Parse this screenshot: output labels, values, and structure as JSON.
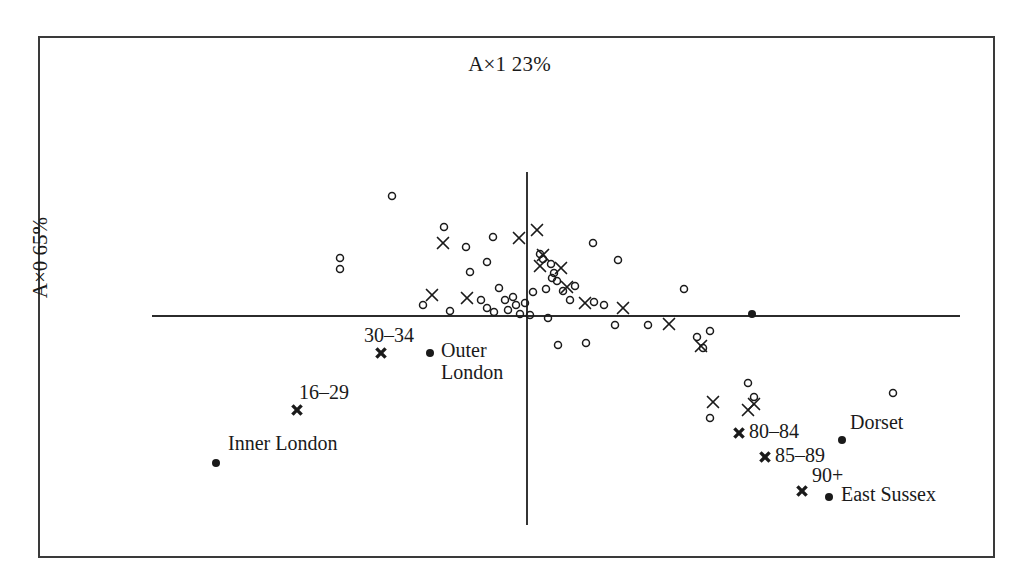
{
  "figure": {
    "title": "A×1 23%",
    "ylabel": "A×0 65%",
    "frame": {
      "x": 38,
      "y": 36,
      "width": 957,
      "height": 522
    }
  },
  "chart_data": {
    "type": "scatter",
    "title": "A×1 23%",
    "xlabel": "",
    "ylabel": "A×0 65%",
    "grid": false,
    "legend": "none",
    "axes": {
      "horizontal_axis_y_px": 316,
      "horizontal_axis_x_start_px": 152,
      "horizontal_axis_x_end_px": 960,
      "vertical_axis_x_px": 527,
      "vertical_axis_y_start_px": 172,
      "vertical_axis_y_end_px": 525,
      "origin_px": [
        527,
        316
      ]
    },
    "series": [
      {
        "name": "districts-open-circle",
        "marker": "open-circle",
        "points": [
          [
            392,
            196
          ],
          [
            444,
            227
          ],
          [
            340,
            258
          ],
          [
            340,
            269
          ],
          [
            466,
            247
          ],
          [
            470,
            272
          ],
          [
            487,
            262
          ],
          [
            493,
            237
          ],
          [
            499,
            288
          ],
          [
            505,
            300
          ],
          [
            481,
            300
          ],
          [
            513,
            297
          ],
          [
            516,
            305
          ],
          [
            525,
            303
          ],
          [
            487,
            308
          ],
          [
            494,
            312
          ],
          [
            508,
            310
          ],
          [
            520,
            314
          ],
          [
            423,
            305
          ],
          [
            450,
            311
          ],
          [
            540,
            254
          ],
          [
            543,
            259
          ],
          [
            551,
            264
          ],
          [
            554,
            273
          ],
          [
            552,
            278
          ],
          [
            557,
            281
          ],
          [
            546,
            289
          ],
          [
            563,
            291
          ],
          [
            575,
            286
          ],
          [
            570,
            300
          ],
          [
            594,
            302
          ],
          [
            604,
            305
          ],
          [
            593,
            243
          ],
          [
            618,
            260
          ],
          [
            548,
            318
          ],
          [
            533,
            292
          ],
          [
            530,
            315
          ],
          [
            615,
            325
          ],
          [
            648,
            325
          ],
          [
            684,
            289
          ],
          [
            558,
            345
          ],
          [
            586,
            343
          ],
          [
            697,
            337
          ],
          [
            703,
            348
          ],
          [
            710,
            331
          ],
          [
            748,
            383
          ],
          [
            754,
            397
          ],
          [
            710,
            418
          ],
          [
            893,
            393
          ]
        ]
      },
      {
        "name": "districts-cross",
        "marker": "cross",
        "points": [
          [
            432,
            295
          ],
          [
            467,
            298
          ],
          [
            443,
            243
          ],
          [
            519,
            238
          ],
          [
            537,
            230
          ],
          [
            543,
            255
          ],
          [
            540,
            266
          ],
          [
            561,
            268
          ],
          [
            567,
            287
          ],
          [
            585,
            303
          ],
          [
            623,
            308
          ],
          [
            669,
            324
          ],
          [
            701,
            346
          ],
          [
            713,
            402
          ],
          [
            748,
            410
          ],
          [
            754,
            404
          ]
        ]
      },
      {
        "name": "age-groups-labelled",
        "marker": "bold-cross",
        "points": [
          {
            "label": "30–34",
            "x": 381,
            "y": 353,
            "label_dx": -17,
            "label_dy": -28
          },
          {
            "label": "16–29",
            "x": 297,
            "y": 410,
            "label_dx": 2,
            "label_dy": -28
          },
          {
            "label": "80–84",
            "x": 739,
            "y": 433,
            "label_dx": 10,
            "label_dy": -12
          },
          {
            "label": "85–89",
            "x": 765,
            "y": 457,
            "label_dx": 10,
            "label_dy": -12
          },
          {
            "label": "90+",
            "x": 802,
            "y": 491,
            "label_dx": 10,
            "label_dy": -26
          }
        ]
      },
      {
        "name": "regions-labelled",
        "marker": "filled-dot",
        "points": [
          {
            "label": "Outer London",
            "x": 430,
            "y": 353,
            "label_dx": 11,
            "label_dy": -14,
            "lines": [
              "Outer",
              "London"
            ]
          },
          {
            "label": "Inner London",
            "x": 216,
            "y": 463,
            "label_dx": 12,
            "label_dy": -30,
            "lines": [
              "Inner London"
            ]
          },
          {
            "label": "Dorset",
            "x": 842,
            "y": 440,
            "label_dx": 8,
            "label_dy": -28,
            "lines": [
              "Dorset"
            ]
          },
          {
            "label": "East Sussex",
            "x": 829,
            "y": 497,
            "label_dx": 12,
            "label_dy": -13,
            "lines": [
              "East Sussex"
            ]
          },
          {
            "label": "",
            "x": 752,
            "y": 314,
            "label_dx": 0,
            "label_dy": 0,
            "lines": []
          }
        ]
      }
    ]
  },
  "labels": {
    "age_30_34": "30–34",
    "age_16_29": "16–29",
    "age_80_84": "80–84",
    "age_85_89": "85–89",
    "age_90_plus": "90+",
    "outer_london_line1": "Outer",
    "outer_london_line2": "London",
    "inner_london": "Inner London",
    "dorset": "Dorset",
    "east_sussex": "East Sussex"
  },
  "colors": {
    "ink": "#1a1a1a",
    "frame": "#3a3a3a",
    "axis": "#2b2b2b",
    "background": "#ffffff"
  }
}
